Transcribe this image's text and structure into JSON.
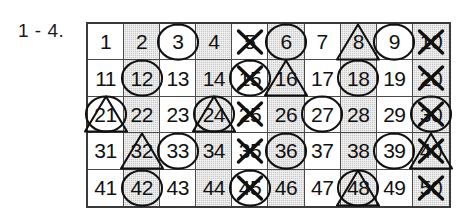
{
  "exercise": {
    "label": "1 - 4."
  },
  "grid": {
    "columns": 10,
    "rows": 5,
    "colors": {
      "shaded_cell": "#c9c9c9",
      "plain_cell": "#ffffff",
      "border": "#3a3a3a",
      "ink": "#111111"
    },
    "mark_legend": {
      "circle": "circled-number",
      "triangle": "triangled-number",
      "cross": "crossed-out-number"
    },
    "cells": [
      {
        "number": "1",
        "shaded": false,
        "marks": []
      },
      {
        "number": "2",
        "shaded": true,
        "marks": []
      },
      {
        "number": "3",
        "shaded": false,
        "marks": [
          "circle"
        ]
      },
      {
        "number": "4",
        "shaded": true,
        "marks": []
      },
      {
        "number": "5",
        "shaded": false,
        "marks": [
          "cross"
        ]
      },
      {
        "number": "6",
        "shaded": true,
        "marks": [
          "circle"
        ]
      },
      {
        "number": "7",
        "shaded": false,
        "marks": []
      },
      {
        "number": "8",
        "shaded": true,
        "marks": [
          "triangle"
        ]
      },
      {
        "number": "9",
        "shaded": false,
        "marks": [
          "circle"
        ]
      },
      {
        "number": "10",
        "shaded": true,
        "marks": [
          "cross"
        ]
      },
      {
        "number": "11",
        "shaded": false,
        "marks": []
      },
      {
        "number": "12",
        "shaded": true,
        "marks": [
          "circle"
        ]
      },
      {
        "number": "13",
        "shaded": false,
        "marks": []
      },
      {
        "number": "14",
        "shaded": true,
        "marks": []
      },
      {
        "number": "15",
        "shaded": false,
        "marks": [
          "circle",
          "cross"
        ]
      },
      {
        "number": "16",
        "shaded": true,
        "marks": [
          "triangle"
        ]
      },
      {
        "number": "17",
        "shaded": false,
        "marks": []
      },
      {
        "number": "18",
        "shaded": true,
        "marks": [
          "circle"
        ]
      },
      {
        "number": "19",
        "shaded": false,
        "marks": []
      },
      {
        "number": "20",
        "shaded": true,
        "marks": [
          "cross"
        ]
      },
      {
        "number": "21",
        "shaded": false,
        "marks": [
          "circle",
          "triangle"
        ]
      },
      {
        "number": "22",
        "shaded": true,
        "marks": []
      },
      {
        "number": "23",
        "shaded": false,
        "marks": []
      },
      {
        "number": "24",
        "shaded": true,
        "marks": [
          "circle",
          "triangle"
        ]
      },
      {
        "number": "25",
        "shaded": false,
        "marks": [
          "cross"
        ]
      },
      {
        "number": "26",
        "shaded": true,
        "marks": []
      },
      {
        "number": "27",
        "shaded": false,
        "marks": [
          "circle"
        ]
      },
      {
        "number": "28",
        "shaded": true,
        "marks": []
      },
      {
        "number": "29",
        "shaded": false,
        "marks": []
      },
      {
        "number": "30",
        "shaded": true,
        "marks": [
          "circle",
          "cross"
        ]
      },
      {
        "number": "31",
        "shaded": false,
        "marks": []
      },
      {
        "number": "32",
        "shaded": true,
        "marks": [
          "triangle"
        ]
      },
      {
        "number": "33",
        "shaded": false,
        "marks": [
          "circle"
        ]
      },
      {
        "number": "34",
        "shaded": true,
        "marks": []
      },
      {
        "number": "35",
        "shaded": false,
        "marks": [
          "cross"
        ]
      },
      {
        "number": "36",
        "shaded": true,
        "marks": [
          "circle"
        ]
      },
      {
        "number": "37",
        "shaded": false,
        "marks": []
      },
      {
        "number": "38",
        "shaded": true,
        "marks": []
      },
      {
        "number": "39",
        "shaded": false,
        "marks": [
          "circle"
        ]
      },
      {
        "number": "40",
        "shaded": true,
        "marks": [
          "triangle",
          "cross"
        ]
      },
      {
        "number": "41",
        "shaded": false,
        "marks": []
      },
      {
        "number": "42",
        "shaded": true,
        "marks": [
          "circle"
        ]
      },
      {
        "number": "43",
        "shaded": false,
        "marks": []
      },
      {
        "number": "44",
        "shaded": true,
        "marks": []
      },
      {
        "number": "45",
        "shaded": false,
        "marks": [
          "circle",
          "cross"
        ]
      },
      {
        "number": "46",
        "shaded": true,
        "marks": []
      },
      {
        "number": "47",
        "shaded": false,
        "marks": []
      },
      {
        "number": "48",
        "shaded": true,
        "marks": [
          "circle",
          "triangle"
        ]
      },
      {
        "number": "49",
        "shaded": false,
        "marks": []
      },
      {
        "number": "50",
        "shaded": true,
        "marks": [
          "cross"
        ]
      }
    ]
  }
}
